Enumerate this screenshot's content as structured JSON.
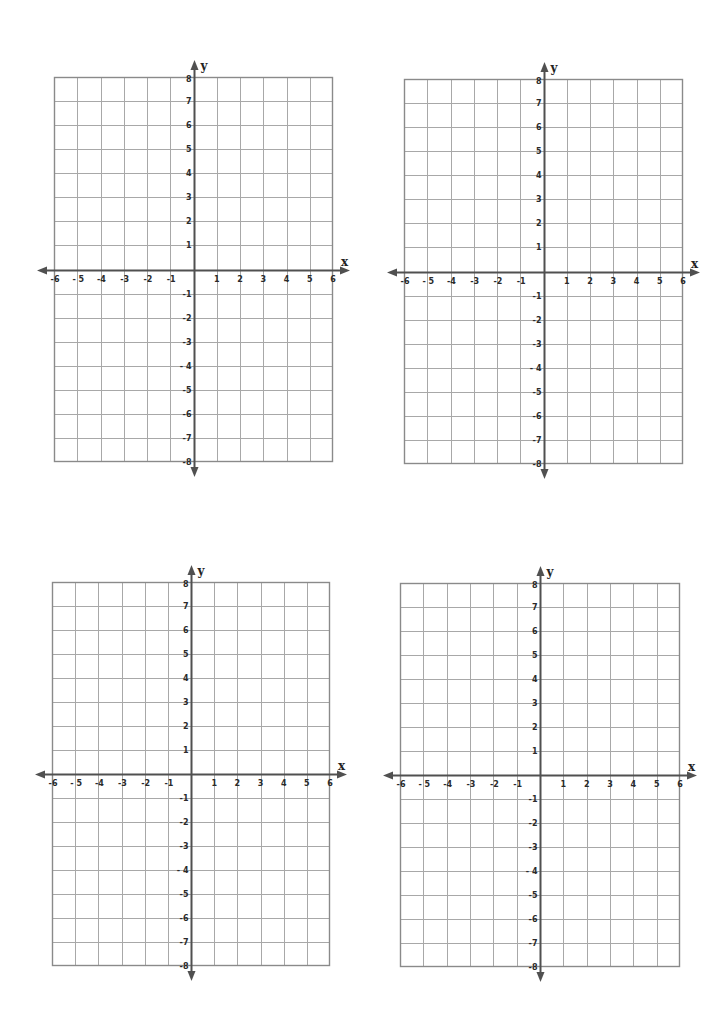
{
  "page": {
    "width": 723,
    "height": 1009,
    "background": "#ffffff"
  },
  "style": {
    "grid_color": "#a8a8a8",
    "frame_color": "#8a8a8a",
    "axis_color": "#505050",
    "label_color": "#2a2a2a"
  },
  "planes": [
    {
      "id": "top-left",
      "left": 54,
      "top": 77,
      "width": 279,
      "height": 385
    },
    {
      "id": "top-right",
      "left": 404,
      "top": 79,
      "width": 279,
      "height": 385
    },
    {
      "id": "bottom-left",
      "left": 52,
      "top": 582,
      "width": 278,
      "height": 384
    },
    {
      "id": "bottom-right",
      "left": 400,
      "top": 583,
      "width": 280,
      "height": 384
    }
  ],
  "axes": {
    "x_label": "x",
    "y_label": "y",
    "x_min": -6,
    "x_max": 6,
    "y_min": -8,
    "y_max": 8,
    "x_ticks": [
      "-6",
      "- 5",
      "-4",
      "-3",
      "-2",
      "-1",
      "1",
      "2",
      "3",
      "4",
      "5",
      "6"
    ],
    "y_ticks_positive": [
      "8",
      "7",
      "6",
      "5",
      "4",
      "3",
      "2",
      "1"
    ],
    "y_ticks_negative": [
      "-1",
      "-2",
      "-3",
      "- 4",
      "-5",
      "-6",
      "-7",
      "-8"
    ]
  },
  "chart_data": [
    {
      "type": "coordinate-grid",
      "title": "",
      "xlabel": "x",
      "ylabel": "y",
      "xlim": [
        -6,
        6
      ],
      "ylim": [
        -8,
        8
      ],
      "grid": true,
      "series": []
    },
    {
      "type": "coordinate-grid",
      "title": "",
      "xlabel": "x",
      "ylabel": "y",
      "xlim": [
        -6,
        6
      ],
      "ylim": [
        -8,
        8
      ],
      "grid": true,
      "series": []
    },
    {
      "type": "coordinate-grid",
      "title": "",
      "xlabel": "x",
      "ylabel": "y",
      "xlim": [
        -6,
        6
      ],
      "ylim": [
        -8,
        8
      ],
      "grid": true,
      "series": []
    },
    {
      "type": "coordinate-grid",
      "title": "",
      "xlabel": "x",
      "ylabel": "y",
      "xlim": [
        -6,
        6
      ],
      "ylim": [
        -8,
        8
      ],
      "grid": true,
      "series": []
    }
  ]
}
